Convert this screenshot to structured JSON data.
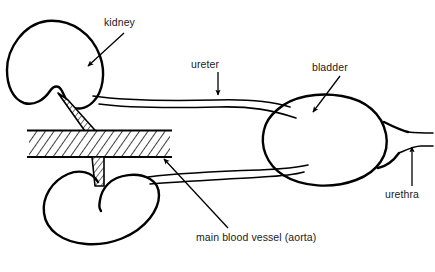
{
  "diagram": {
    "background_color": "#ffffff",
    "ink_color": "#000000",
    "width": 435,
    "height": 272,
    "labels": [
      {
        "id": "kidney",
        "text": "kidney",
        "points_to": "upper kidney organ outline",
        "leader": "arrow pointing down-left"
      },
      {
        "id": "ureter",
        "text": "ureter",
        "points_to": "upper ureter tube",
        "leader": "arrow pointing straight down"
      },
      {
        "id": "bladder",
        "text": "bladder",
        "points_to": "bladder oval",
        "leader": "arrow pointing down-left"
      },
      {
        "id": "urethra",
        "text": "urethra",
        "points_to": "urethra tube at right",
        "leader": "arrow pointing straight up"
      },
      {
        "id": "aorta",
        "text": "main blood vessel (aorta)",
        "points_to": "hatched aorta band",
        "leader": "arrow pointing up-left"
      }
    ],
    "parts": [
      {
        "id": "upper-kidney",
        "name": "kidney (upper)"
      },
      {
        "id": "lower-kidney",
        "name": "kidney (lower)"
      },
      {
        "id": "aorta-band",
        "name": "main blood vessel (aorta)",
        "style": "diagonal hatched band"
      },
      {
        "id": "upper-ureter",
        "name": "ureter (upper)"
      },
      {
        "id": "lower-ureter",
        "name": "ureter (lower)"
      },
      {
        "id": "bladder",
        "name": "bladder"
      },
      {
        "id": "urethra",
        "name": "urethra"
      },
      {
        "id": "upper-renal-stalk",
        "name": "renal stalk (upper)"
      },
      {
        "id": "lower-renal-stalk",
        "name": "renal stalk (lower)"
      }
    ]
  }
}
